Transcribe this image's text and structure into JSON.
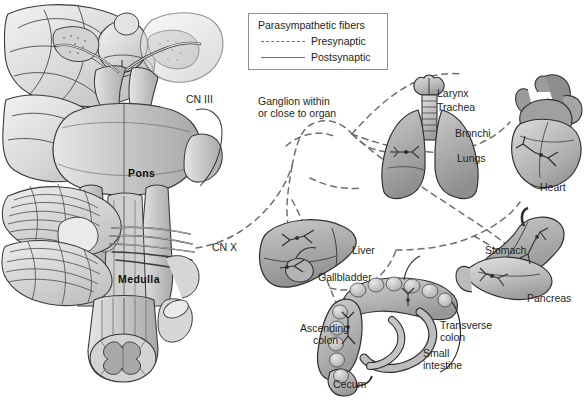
{
  "figure": {
    "background": "#ffffff",
    "ink": "#231f20",
    "fiber_color": "#6f6f6f"
  },
  "legend": {
    "title": "Parasympathetic fibers",
    "items": [
      {
        "label": "Presynaptic",
        "style": "dashed",
        "icon": "dashed-line-icon"
      },
      {
        "label": "Postsynaptic",
        "style": "solid",
        "icon": "solid-line-icon"
      }
    ]
  },
  "brainstem": {
    "panel_name": "brainstem-ventral-view",
    "labels": [
      {
        "id": "cn3",
        "text": "CN III",
        "bold": false,
        "x": 186,
        "y": 94
      },
      {
        "id": "pons",
        "text": "Pons",
        "bold": true,
        "x": 128,
        "y": 168
      },
      {
        "id": "cnx",
        "text": "CN X",
        "bold": false,
        "x": 212,
        "y": 242
      },
      {
        "id": "medulla",
        "text": "Medulla",
        "bold": true,
        "x": 118,
        "y": 274
      }
    ]
  },
  "ganglion_note": {
    "line1": "Ganglion within",
    "line2": "or close to organ",
    "x": 258,
    "y": 96
  },
  "organs": [
    {
      "id": "lungs",
      "name": "lungs-and-airway",
      "labels": [
        {
          "text": "Larynx",
          "x": 437,
          "y": 88
        },
        {
          "text": "Trachea",
          "x": 437,
          "y": 102
        },
        {
          "text": "Bronchi",
          "x": 455,
          "y": 128
        },
        {
          "text": "Lungs",
          "x": 457,
          "y": 153
        }
      ]
    },
    {
      "id": "heart",
      "name": "heart",
      "labels": [
        {
          "text": "Heart",
          "x": 540,
          "y": 182
        }
      ]
    },
    {
      "id": "liver",
      "name": "liver-and-gallbladder",
      "labels": [
        {
          "text": "Liver",
          "x": 352,
          "y": 245
        },
        {
          "text": "Gallbladder",
          "x": 318,
          "y": 272
        }
      ]
    },
    {
      "id": "stomach",
      "name": "stomach-and-pancreas",
      "labels": [
        {
          "text": "Stomach",
          "x": 485,
          "y": 245
        },
        {
          "text": "Pancreas",
          "x": 527,
          "y": 293
        }
      ]
    },
    {
      "id": "intestines",
      "name": "colon-and-small-intestine",
      "labels": [
        {
          "text": "Ascending",
          "x": 300,
          "y": 323
        },
        {
          "text": "colon",
          "x": 313,
          "y": 335
        },
        {
          "text": "Transverse",
          "x": 440,
          "y": 320
        },
        {
          "text": "colon",
          "x": 440,
          "y": 332
        },
        {
          "text": "Small",
          "x": 423,
          "y": 348
        },
        {
          "text": "intestine",
          "x": 423,
          "y": 360
        },
        {
          "text": "Cecum",
          "x": 333,
          "y": 379
        }
      ]
    }
  ]
}
